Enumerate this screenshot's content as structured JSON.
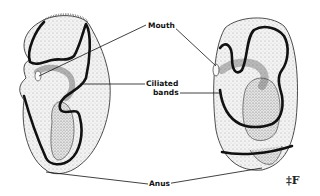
{
  "figure": {
    "type": "anatomical line drawing",
    "labels": {
      "mouth": "Mouth",
      "ciliated_line1": "Ciliated",
      "ciliated_line2": "bands",
      "anus": "Anus"
    },
    "logo_glyph": "‡F",
    "colors": {
      "ink": "#111111",
      "stipple": "#555555",
      "background": "#ffffff"
    }
  }
}
